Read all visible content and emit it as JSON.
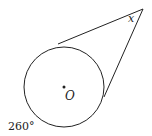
{
  "diagram": {
    "circle": {
      "cx": 64,
      "cy": 87,
      "r": 40,
      "center_label": "O"
    },
    "apex": {
      "x": 143,
      "y": 9,
      "angle_label": "x"
    },
    "tangent_points": [
      {
        "x": 58,
        "y": 44
      },
      {
        "x": 104,
        "y": 97
      }
    ],
    "arc_label": "260°",
    "stroke_color": "#222222"
  }
}
